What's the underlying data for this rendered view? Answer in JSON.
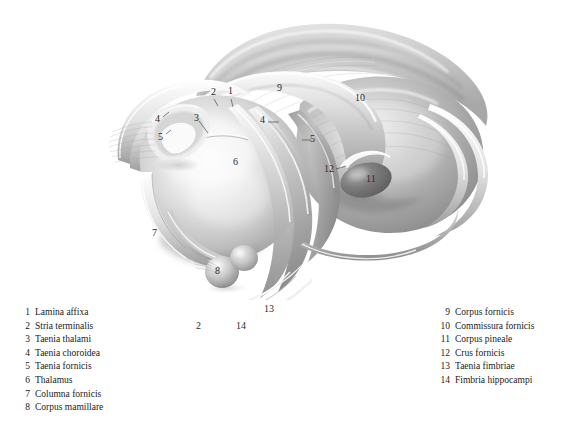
{
  "plate": {
    "title": "Fornix and thalamus, superior-lateral view",
    "background_color": "#ffffff",
    "ink_color": "#2b2b2b"
  },
  "illustration": {
    "name": "fornix-thalamus-illustration",
    "style": "grayscale pencil and airbrush anatomical rendering",
    "tones": {
      "paper": "#ffffff",
      "light": "#f2f2f2",
      "mid_light": "#dcdcdc",
      "mid": "#bcbcbc",
      "mid_dark": "#9a9a9a",
      "dark": "#7a7a7a",
      "deepest": "#5e5e5e"
    }
  },
  "callouts": [
    {
      "id": "1",
      "text": "1",
      "x": 228,
      "y": 92
    },
    {
      "id": "2",
      "text": "2",
      "x": 211,
      "y": 93
    },
    {
      "id": "3",
      "text": "3",
      "x": 194,
      "y": 119
    },
    {
      "id": "4a",
      "text": "4",
      "x": 156,
      "y": 120
    },
    {
      "id": "5a",
      "text": "5",
      "x": 159,
      "y": 138
    },
    {
      "id": "4b",
      "text": "4",
      "x": 261,
      "y": 121
    },
    {
      "id": "5b",
      "text": "5",
      "x": 308,
      "y": 142
    },
    {
      "id": "6",
      "text": "6",
      "x": 233,
      "y": 163
    },
    {
      "id": "7",
      "text": "7",
      "x": 152,
      "y": 234
    },
    {
      "id": "8",
      "text": "8",
      "x": 215,
      "y": 272
    },
    {
      "id": "9",
      "text": "9",
      "x": 277,
      "y": 89
    },
    {
      "id": "10",
      "text": "10",
      "x": 357,
      "y": 99
    },
    {
      "id": "11",
      "text": "11",
      "x": 369,
      "y": 180
    },
    {
      "id": "12",
      "text": "12",
      "x": 326,
      "y": 170
    },
    {
      "id": "13",
      "text": "13",
      "x": 265,
      "y": 310
    },
    {
      "id": "14",
      "text": "14",
      "x": 237,
      "y": 327
    },
    {
      "id": "2b",
      "text": "2",
      "x": 196,
      "y": 327
    }
  ],
  "legend": {
    "left_column": [
      {
        "num": "1",
        "label": "Lamina affixa"
      },
      {
        "num": "2",
        "label": "Stria terminalis"
      },
      {
        "num": "3",
        "label": "Taenia thalami"
      },
      {
        "num": "4",
        "label": "Taenia choroidea"
      },
      {
        "num": "5",
        "label": "Taenia fornicis"
      },
      {
        "num": "6",
        "label": "Thalamus"
      },
      {
        "num": "7",
        "label": "Columna fornicis"
      },
      {
        "num": "8",
        "label": "Corpus mamillare"
      }
    ],
    "right_column": [
      {
        "num": "9",
        "label": "Corpus fornicis"
      },
      {
        "num": "10",
        "label": "Commissura fornicis"
      },
      {
        "num": "11",
        "label": "Corpus pineale"
      },
      {
        "num": "12",
        "label": "Crus fornicis"
      },
      {
        "num": "13",
        "label": "Taenia fimbriae"
      },
      {
        "num": "14",
        "label": "Fimbria hippocampi"
      }
    ]
  }
}
